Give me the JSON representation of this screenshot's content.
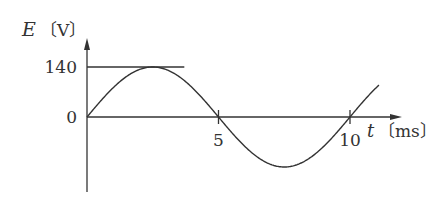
{
  "chart_data": {
    "type": "line",
    "title": "",
    "xlabel": "t",
    "xunit": "〔ms〕",
    "ylabel": "E",
    "yunit": "〔V〕",
    "function": "E = 140·sin(2πt/10)",
    "amplitude": 140,
    "period": 10,
    "xlim": [
      0,
      12
    ],
    "ylim": [
      -140,
      140
    ],
    "x_plotted_range": [
      0,
      11.1
    ],
    "x_ticks": [
      {
        "value": 5,
        "label": "5"
      },
      {
        "value": 10,
        "label": "10"
      }
    ],
    "y_ticks": [
      {
        "value": 140,
        "label": "140"
      },
      {
        "value": 0,
        "label": "0"
      }
    ],
    "reference_line": {
      "value": 140,
      "x_range": [
        0,
        3.7
      ]
    },
    "grid": false,
    "legend": "none",
    "color": "#333333"
  }
}
